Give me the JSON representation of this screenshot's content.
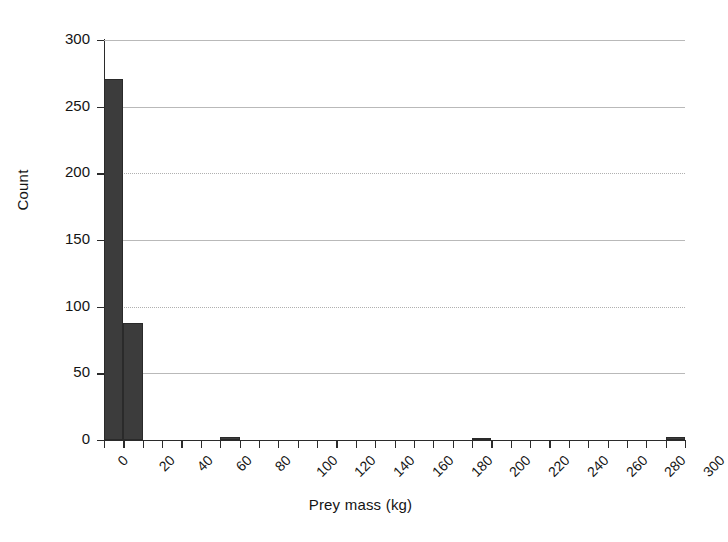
{
  "chart_data": {
    "type": "bar",
    "title": "",
    "subtitle": "",
    "xlabel": "Prey mass (kg)",
    "ylabel": "Count",
    "xlim": [
      0,
      300
    ],
    "ylim": [
      0,
      300
    ],
    "grid": true,
    "legend": null,
    "bin_width": 10,
    "x_tick_values": [
      0,
      10,
      20,
      30,
      40,
      50,
      60,
      70,
      80,
      90,
      100,
      110,
      120,
      130,
      140,
      150,
      160,
      170,
      180,
      190,
      200,
      210,
      220,
      230,
      240,
      250,
      260,
      270,
      280,
      290,
      300
    ],
    "x_tick_labels": [
      "0",
      "20",
      "40",
      "60",
      "80",
      "100",
      "120",
      "140",
      "160",
      "180",
      "200",
      "220",
      "240",
      "260",
      "280",
      "300"
    ],
    "x_labeled_values": [
      0,
      20,
      40,
      60,
      80,
      100,
      120,
      140,
      160,
      180,
      200,
      220,
      240,
      260,
      280,
      300
    ],
    "y_tick_values": [
      0,
      50,
      100,
      150,
      200,
      250,
      300
    ],
    "y_tick_labels": [
      "0",
      "50",
      "100",
      "150",
      "200",
      "250",
      "300"
    ],
    "bin_edges": [
      0,
      10,
      20,
      30,
      40,
      50,
      60,
      70,
      80,
      90,
      100,
      110,
      120,
      130,
      140,
      150,
      160,
      170,
      180,
      190,
      200,
      210,
      220,
      230,
      240,
      250,
      260,
      270,
      280,
      290,
      300
    ],
    "categories": [
      "0-10",
      "10-20",
      "20-30",
      "30-40",
      "40-50",
      "50-60",
      "60-70",
      "70-80",
      "80-90",
      "90-100",
      "100-110",
      "110-120",
      "120-130",
      "130-140",
      "140-150",
      "150-160",
      "160-170",
      "170-180",
      "180-190",
      "190-200",
      "200-210",
      "210-220",
      "220-230",
      "230-240",
      "240-250",
      "250-260",
      "260-270",
      "270-280",
      "280-290",
      "290-300"
    ],
    "values": [
      271,
      88,
      0,
      0,
      0,
      0,
      2,
      0,
      0,
      0,
      0,
      0,
      0,
      0,
      0,
      0,
      0,
      0,
      0,
      1,
      0,
      0,
      0,
      0,
      0,
      0,
      0,
      0,
      0,
      2
    ],
    "bar_color": "#3c3c3c",
    "grid_color": "#b9b9b9",
    "axis_color": "#2b2b2b"
  }
}
